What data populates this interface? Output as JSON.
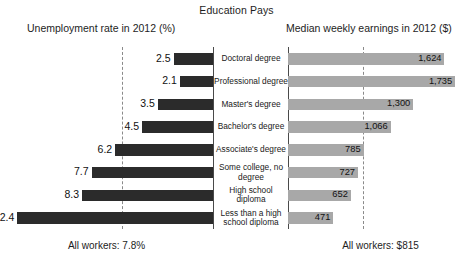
{
  "chart_data": {
    "type": "bar",
    "title": "Education Pays",
    "subtitle": "",
    "orientation": "horizontal-diverging",
    "categories": [
      "Doctoral degree",
      "Professional degree",
      "Master's degree",
      "Bachelor's degree",
      "Associate's degree",
      "Some college, no degree",
      "High school diploma",
      "Less than a high school diploma"
    ],
    "series": [
      {
        "name": "Unemployment rate in 2012 (%)",
        "side": "left",
        "unit": "%",
        "color": "#2b2b2b",
        "values": [
          2.5,
          2.1,
          3.5,
          4.5,
          6.2,
          7.7,
          8.3,
          12.4
        ],
        "labels": [
          "2.5",
          "2.1",
          "3.5",
          "4.5",
          "6.2",
          "7.7",
          "8.3",
          "12.4"
        ],
        "xlim": [
          0,
          13.5
        ],
        "reference_line": {
          "value": 7.8,
          "label": "All workers: 7.8%"
        }
      },
      {
        "name": "Median weekly earnings in 2012 ($)",
        "side": "right",
        "unit": "$",
        "color": "#a8a8a8",
        "values": [
          1624,
          1735,
          1300,
          1066,
          785,
          727,
          652,
          471
        ],
        "labels": [
          "1,624",
          "1,735",
          "1,300",
          "1,066",
          "785",
          "727",
          "652",
          "471"
        ],
        "xlim": [
          0,
          1920
        ],
        "reference_line": {
          "value": 815,
          "label": "All workers: $815"
        }
      }
    ],
    "xlabel": "",
    "ylabel": "",
    "grid": false,
    "legend": "none"
  },
  "header": {
    "title": "Education Pays",
    "left_axis_title": "Unemployment rate in 2012 (%)",
    "right_axis_title": "Median weekly earnings in 2012 ($)"
  },
  "rows": [
    {
      "label": "Doctoral degree",
      "unemployment": "2.5",
      "earnings": "1,624"
    },
    {
      "label": "Professional degree",
      "unemployment": "2.1",
      "earnings": "1,735"
    },
    {
      "label": "Master's degree",
      "unemployment": "3.5",
      "earnings": "1,300"
    },
    {
      "label": "Bachelor's degree",
      "unemployment": "4.5",
      "earnings": "1,066"
    },
    {
      "label": "Associate's degree",
      "unemployment": "6.2",
      "earnings": "785"
    },
    {
      "label": "Some college, no degree",
      "unemployment": "7.7",
      "earnings": "727"
    },
    {
      "label": "High school diploma",
      "unemployment": "8.3",
      "earnings": "652"
    },
    {
      "label": "Less than a high school diploma",
      "unemployment": "12.4",
      "earnings": "471"
    }
  ],
  "footnotes": {
    "left": "All workers: 7.8%",
    "right": "All workers: $815"
  },
  "colors": {
    "unemployment_bar": "#2b2b2b",
    "earnings_bar": "#a8a8a8",
    "average_line": "#8a8a8a",
    "center_rule": "#4a4a4a",
    "background": "#ffffff"
  }
}
